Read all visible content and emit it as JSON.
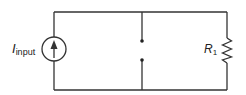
{
  "diagram": {
    "type": "circuit",
    "components": [
      {
        "id": "current-source",
        "kind": "current source",
        "label_main": "I",
        "label_sub": "input",
        "arrow": "up"
      },
      {
        "id": "open-switch",
        "kind": "open terminals / switch",
        "terminals": 2
      },
      {
        "id": "resistor-r1",
        "kind": "resistor",
        "label_main": "R",
        "label_sub": "1"
      }
    ],
    "colors": {
      "wire": "#333333",
      "background": "#ffffff"
    }
  }
}
